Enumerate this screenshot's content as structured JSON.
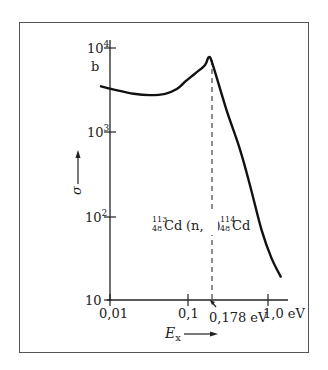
{
  "chart_data": {
    "type": "line",
    "title": "",
    "xlabel": "E_x",
    "ylabel": "σ",
    "y_unit": "b",
    "x_scale": "log",
    "y_scale": "log",
    "xlim": [
      0.0077,
      1.45
    ],
    "ylim": [
      10,
      10000
    ],
    "x_ticks": [
      0.01,
      0.1,
      1.0
    ],
    "x_tick_labels": [
      "0,01",
      "0,1",
      "1,0 eV"
    ],
    "y_ticks": [
      10,
      100,
      1000,
      10000
    ],
    "y_tick_labels": [
      "10",
      "10²",
      "10³",
      "10⁴"
    ],
    "grid": false,
    "legend": null,
    "series": [
      {
        "name": "113Cd(n,γ)114Cd cross section",
        "x": [
          0.0077,
          0.012,
          0.02,
          0.032,
          0.05,
          0.07,
          0.09,
          0.12,
          0.16,
          0.178,
          0.2,
          0.3,
          0.44,
          0.6,
          0.83,
          1.1,
          1.45
        ],
        "y": [
          3500,
          3150,
          2850,
          2750,
          2850,
          3250,
          4000,
          5000,
          6300,
          7800,
          6300,
          1800,
          630,
          220,
          68,
          32,
          19
        ]
      }
    ],
    "annotations": [
      {
        "text": "¹¹³₄₈Cd (n, γ) ¹¹⁴₄₈Cd",
        "x": 0.178,
        "type": "reaction-label"
      },
      {
        "text": "0,178 eV",
        "x": 0.178,
        "type": "resonance-marker",
        "style": "dashed-vertical"
      }
    ]
  },
  "labels": {
    "y_unit": "b",
    "y_tick_10": "10",
    "y_tick_100_base": "10",
    "y_tick_100_exp": "2",
    "y_tick_1000_base": "10",
    "y_tick_1000_exp": "3",
    "y_tick_10000_base": "10",
    "y_tick_10000_exp": "4",
    "x_tick_001": "0,01",
    "x_tick_01": "0,1",
    "x_tick_1": "1,0 eV",
    "resonance": "0,178 eV",
    "ylabel": "σ",
    "xlabel_main": "E",
    "xlabel_sub": "x",
    "reaction_target_mass": "113",
    "reaction_target_z": "48",
    "reaction_target_el": "Cd",
    "reaction_mid": "(n, γ)",
    "reaction_product_mass": "114",
    "reaction_product_z": "48",
    "reaction_product_el": "Cd"
  }
}
